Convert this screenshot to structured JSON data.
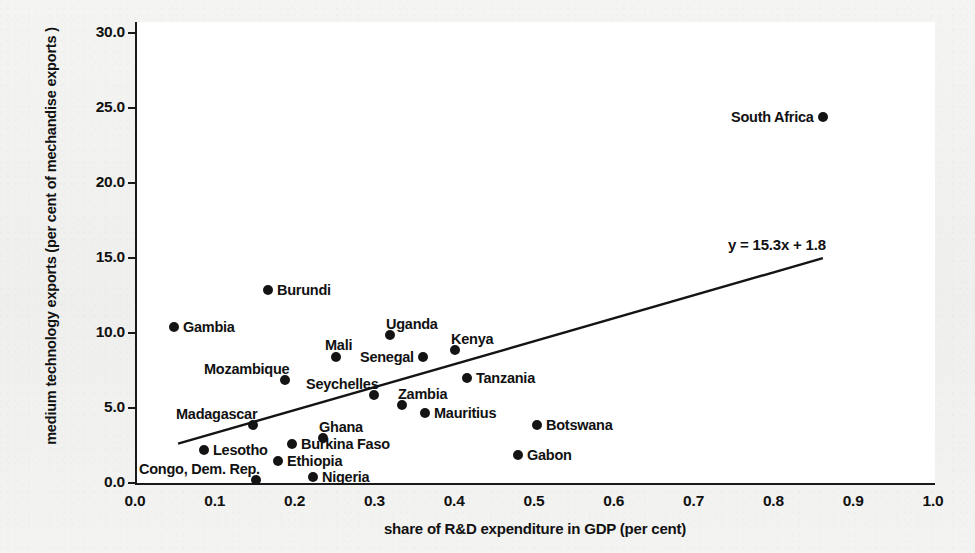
{
  "chart_data": {
    "type": "scatter",
    "title": "",
    "xlabel": "share of R&D expenditure in GDP (per cent)",
    "ylabel": "medium technology exports (per cent of mechandise exports )",
    "xlim": [
      0.0,
      1.0
    ],
    "ylim": [
      0.0,
      30.0
    ],
    "grid": false,
    "legend": "none",
    "x_ticks": [
      "0.0",
      "0.1",
      "0.2",
      "0.3",
      "0.4",
      "0.5",
      "0.6",
      "0.7",
      "0.8",
      "0.9",
      "1.0"
    ],
    "y_ticks": [
      "0.0",
      "5.0",
      "10.0",
      "15.0",
      "20.0",
      "25.0",
      "30.0"
    ],
    "annotations": [
      {
        "name": "trendline-equation",
        "text": "y = 15.3x + 1.8"
      }
    ],
    "trendline": {
      "equation": "y = 15.3x + 1.8",
      "slope": 15.3,
      "intercept": 1.8,
      "x_start": 0.054,
      "x_end": 0.862
    },
    "points": [
      {
        "label": "South Africa",
        "x": 0.862,
        "y": 24.4,
        "label_side": "left"
      },
      {
        "label": "Burundi",
        "x": 0.167,
        "y": 12.9,
        "label_side": "right"
      },
      {
        "label": "Gambia",
        "x": 0.049,
        "y": 10.4,
        "label_side": "right"
      },
      {
        "label": "Uganda",
        "x": 0.32,
        "y": 9.9,
        "label_side": "above-right"
      },
      {
        "label": "Kenya",
        "x": 0.401,
        "y": 8.9,
        "label_side": "above-right"
      },
      {
        "label": "Mali",
        "x": 0.252,
        "y": 8.4,
        "label_side": "above"
      },
      {
        "label": "Senegal",
        "x": 0.361,
        "y": 8.4,
        "label_side": "left"
      },
      {
        "label": "Mozambique",
        "x": 0.188,
        "y": 6.9,
        "label_side": "above-left"
      },
      {
        "label": "Tanzania",
        "x": 0.416,
        "y": 7.0,
        "label_side": "right"
      },
      {
        "label": "Seychelles",
        "x": 0.299,
        "y": 5.9,
        "label_side": "above-left"
      },
      {
        "label": "Zambia",
        "x": 0.334,
        "y": 5.2,
        "label_side": "above-right"
      },
      {
        "label": "Mauritius",
        "x": 0.364,
        "y": 4.7,
        "label_side": "right"
      },
      {
        "label": "Botswana",
        "x": 0.504,
        "y": 3.9,
        "label_side": "right"
      },
      {
        "label": "Madagascar",
        "x": 0.148,
        "y": 3.9,
        "label_side": "above-left"
      },
      {
        "label": "Ghana",
        "x": 0.236,
        "y": 3.0,
        "label_side": "above-right"
      },
      {
        "label": "Burkina Faso",
        "x": 0.197,
        "y": 2.6,
        "label_side": "right"
      },
      {
        "label": "Gabon",
        "x": 0.48,
        "y": 1.9,
        "label_side": "right"
      },
      {
        "label": "Lesotho",
        "x": 0.086,
        "y": 2.2,
        "label_side": "right"
      },
      {
        "label": "Ethiopia",
        "x": 0.179,
        "y": 1.5,
        "label_side": "right"
      },
      {
        "label": "Congo, Dem. Rep.",
        "x": 0.152,
        "y": 0.2,
        "label_side": "above-left"
      },
      {
        "label": "Nigeria",
        "x": 0.223,
        "y": 0.4,
        "label_side": "right"
      }
    ]
  },
  "axes": {
    "y_title": "medium technology exports (per cent of mechandise exports )",
    "x_title": "share of R&D expenditure in GDP (per cent)",
    "y_tick_labels": [
      "30.0",
      "25.0",
      "20.0",
      "15.0",
      "10.0",
      "5.0",
      "0.0"
    ],
    "x_tick_labels": [
      "0.0",
      "0.1",
      "0.2",
      "0.3",
      "0.4",
      "0.5",
      "0.6",
      "0.7",
      "0.8",
      "0.9",
      "1.0"
    ]
  },
  "colors": {
    "ink": "#141414",
    "paper": "#f2f2f0",
    "plot_background": "#ffffff"
  }
}
